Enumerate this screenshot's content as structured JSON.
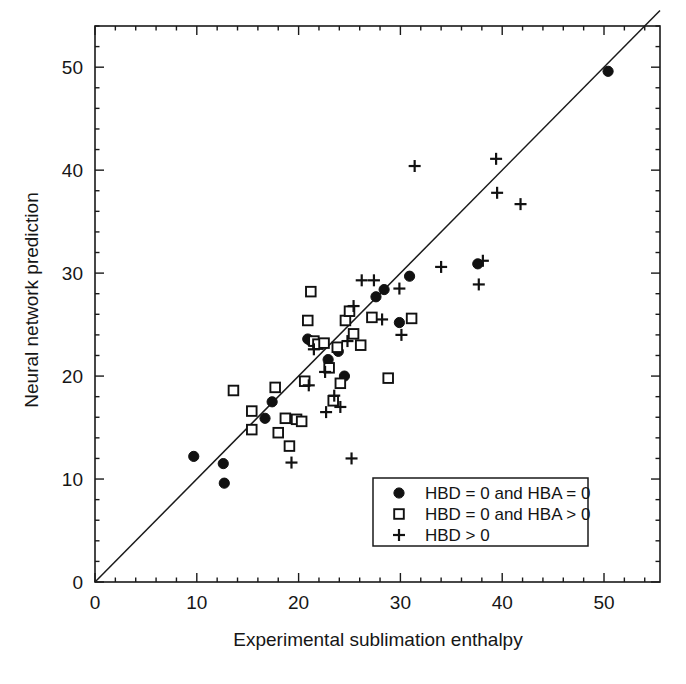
{
  "chart_data": {
    "type": "scatter",
    "title": "",
    "xlabel": "Experimental sublimation enthalpy",
    "ylabel": "Neural network prediction",
    "xlim": [
      0,
      55.5
    ],
    "ylim": [
      0,
      54
    ],
    "xticks": [
      0,
      10,
      20,
      30,
      40,
      50
    ],
    "yticks": [
      0,
      10,
      20,
      30,
      40,
      50
    ],
    "xtick_labels": [
      "0",
      "10",
      "20",
      "30",
      "40",
      "50"
    ],
    "ytick_labels": [
      "0",
      "10",
      "20",
      "30",
      "40",
      "50"
    ],
    "grid": false,
    "minor_ticks": true,
    "reference_line": {
      "name": "identity-line",
      "description": "y = x parity line",
      "from": [
        0,
        0
      ],
      "to": [
        55.5,
        55.5
      ]
    },
    "legend": {
      "position": "bottom-right",
      "entries": [
        {
          "marker": "filled-circle",
          "label": "HBD = 0 and HBA = 0"
        },
        {
          "marker": "open-square",
          "label": "HBD = 0 and HBA > 0"
        },
        {
          "marker": "plus",
          "label": "HBD > 0"
        }
      ]
    },
    "series": [
      {
        "name": "HBD = 0 and HBA = 0",
        "marker": "filled-circle",
        "color": "#111111",
        "points": [
          [
            9.7,
            12.2
          ],
          [
            12.6,
            11.5
          ],
          [
            12.7,
            9.6
          ],
          [
            16.7,
            15.9
          ],
          [
            17.4,
            17.5
          ],
          [
            20.9,
            23.6
          ],
          [
            21.2,
            23.4
          ],
          [
            22.9,
            21.6
          ],
          [
            23.9,
            22.4
          ],
          [
            24.5,
            20.0
          ],
          [
            27.6,
            27.7
          ],
          [
            28.4,
            28.4
          ],
          [
            29.9,
            25.2
          ],
          [
            30.9,
            29.7
          ],
          [
            37.6,
            30.9
          ],
          [
            50.4,
            49.6
          ]
        ]
      },
      {
        "name": "HBD = 0 and HBA > 0",
        "marker": "open-square",
        "color": "#111111",
        "points": [
          [
            13.6,
            18.6
          ],
          [
            15.4,
            16.6
          ],
          [
            15.4,
            14.8
          ],
          [
            17.7,
            18.9
          ],
          [
            18.0,
            14.5
          ],
          [
            18.7,
            15.9
          ],
          [
            19.1,
            13.2
          ],
          [
            19.8,
            15.8
          ],
          [
            20.3,
            15.6
          ],
          [
            20.6,
            19.5
          ],
          [
            20.9,
            25.4
          ],
          [
            21.2,
            28.2
          ],
          [
            21.5,
            23.4
          ],
          [
            21.9,
            23.1
          ],
          [
            22.5,
            23.2
          ],
          [
            23.0,
            20.8
          ],
          [
            23.4,
            17.6
          ],
          [
            23.8,
            22.8
          ],
          [
            24.1,
            19.3
          ],
          [
            24.6,
            25.4
          ],
          [
            25.0,
            26.3
          ],
          [
            25.4,
            24.1
          ],
          [
            26.1,
            23.0
          ],
          [
            27.2,
            25.7
          ],
          [
            28.8,
            19.8
          ],
          [
            31.1,
            25.6
          ]
        ]
      },
      {
        "name": "HBD > 0",
        "marker": "plus",
        "color": "#111111",
        "points": [
          [
            19.3,
            11.6
          ],
          [
            21.0,
            19.1
          ],
          [
            21.5,
            22.6
          ],
          [
            22.6,
            20.4
          ],
          [
            22.7,
            16.5
          ],
          [
            23.5,
            18.1
          ],
          [
            24.1,
            17.0
          ],
          [
            24.8,
            23.4
          ],
          [
            25.4,
            26.8
          ],
          [
            26.2,
            29.3
          ],
          [
            27.4,
            29.3
          ],
          [
            28.2,
            25.5
          ],
          [
            31.4,
            40.4
          ],
          [
            34.0,
            30.6
          ],
          [
            37.7,
            28.9
          ],
          [
            38.1,
            31.2
          ],
          [
            39.4,
            41.1
          ],
          [
            39.5,
            37.8
          ],
          [
            41.8,
            36.7
          ],
          [
            25.2,
            12.0
          ],
          [
            30.1,
            24.0
          ],
          [
            29.9,
            28.5
          ]
        ]
      }
    ]
  }
}
